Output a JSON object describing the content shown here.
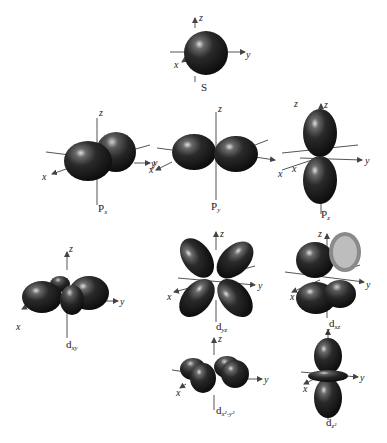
{
  "axis_labels": {
    "x": "x",
    "y": "y",
    "z": "z"
  },
  "orbitals": [
    {
      "id": "s",
      "main": "S",
      "sub": ""
    },
    {
      "id": "px",
      "main": "P",
      "sub": "x"
    },
    {
      "id": "py",
      "main": "P",
      "sub": "y"
    },
    {
      "id": "pz",
      "main": "P",
      "sub": "z"
    },
    {
      "id": "dxy",
      "main": "d",
      "sub": "xy"
    },
    {
      "id": "dyz",
      "main": "d",
      "sub": "yz"
    },
    {
      "id": "dxz",
      "main": "d",
      "sub": "xz"
    },
    {
      "id": "dx2y2",
      "main": "d",
      "sub": "x²-y²"
    },
    {
      "id": "dz2",
      "main": "d",
      "sub": "z²"
    }
  ],
  "colors": {
    "lobe_dark": "#1a1a1a",
    "lobe_mid": "#3a3a3a",
    "highlight": "#d8d8d8",
    "axis": "#555555"
  }
}
